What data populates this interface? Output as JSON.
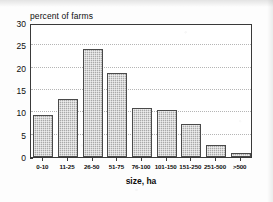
{
  "chart_data": {
    "type": "bar",
    "title": "",
    "xlabel": "size, ha",
    "ylabel": "percent of farms",
    "categories": [
      "0-10",
      "11-25",
      "26-50",
      "51-75",
      "76-100",
      "101-150",
      "151-250",
      "251-500",
      ">500"
    ],
    "values": [
      9.4,
      13.0,
      24.1,
      18.7,
      11.0,
      10.5,
      7.5,
      2.6,
      0.8
    ],
    "ylim": [
      0,
      30
    ],
    "yticks": [
      0,
      5,
      10,
      15,
      20,
      25,
      30
    ],
    "ytick_labels": [
      "0",
      "5",
      "10",
      "15",
      "20",
      "25",
      "30"
    ],
    "grid": true,
    "grid_axis": "y",
    "legend": "none",
    "bar_fill_color": "#a9a9a9",
    "bar_edge_color": "#4a4a4a",
    "axis_color": "#3a3a3a",
    "grid_color": "#b5b5b5",
    "background_color": "#ffffff"
  }
}
